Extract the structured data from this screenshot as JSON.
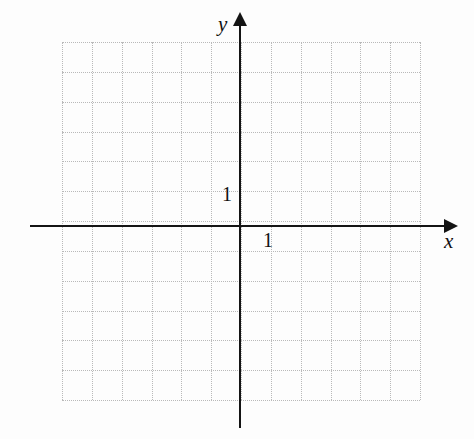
{
  "figure": {
    "type": "blank-cartesian-grid",
    "background_color": "#fdfdfd",
    "axis_color": "#141414",
    "grid_color": "#b9b9b9",
    "axes": {
      "x": {
        "label": "x",
        "unit_tick_label": "1"
      },
      "y": {
        "label": "y",
        "unit_tick_label": "1"
      }
    }
  },
  "chart_data": {
    "type": "scatter",
    "title": "",
    "subtitle": "",
    "xlabel": "x",
    "ylabel": "y",
    "series": [],
    "x": [],
    "values": [],
    "annotations": [],
    "legend": [],
    "legend_position": "none",
    "grid": true,
    "grid_style": "dotted",
    "grid_spacing_units": 1,
    "origin_label": "",
    "xlim": [
      -6,
      6
    ],
    "ylim": [
      -6,
      6
    ],
    "xticks": [
      -6,
      -5,
      -4,
      -3,
      -2,
      -1,
      0,
      1,
      2,
      3,
      4,
      5,
      6
    ],
    "yticks": [
      -6,
      -5,
      -4,
      -3,
      -2,
      -1,
      0,
      1,
      2,
      3,
      4,
      5,
      6
    ],
    "labeled_xticks": [
      "1"
    ],
    "labeled_yticks": [
      "1"
    ],
    "axis_arrows": [
      "x-positive",
      "y-positive"
    ]
  },
  "grid_geometry": {
    "columns": 12,
    "rows": 12,
    "cell_size_px": 29.83,
    "left_px": 62,
    "top_px": 42,
    "width_px": 358,
    "height_px": 358,
    "origin_x_px": 240,
    "origin_y_px": 226
  }
}
